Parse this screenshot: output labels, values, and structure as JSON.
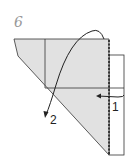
{
  "diagram": {
    "step_number": "6",
    "labels": [
      {
        "id": "arrow-1",
        "text": "1"
      },
      {
        "id": "arrow-2",
        "text": "2"
      }
    ],
    "colors": {
      "paper_fill": "#e1e1e1",
      "paper_stroke": "#333333",
      "background": "#ffffff"
    }
  }
}
